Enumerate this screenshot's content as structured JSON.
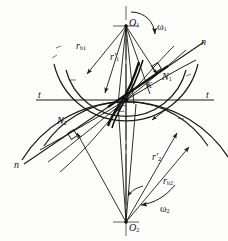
{
  "figure": {
    "type": "engineering-diagram",
    "background_color": "#fdfdfc",
    "ink_color": "#1a1a1a"
  },
  "labels": {
    "o1": "O",
    "o1_sub": "1",
    "o2": "O",
    "o2_sub": "2",
    "omega1": "ω",
    "omega1_sub": "1",
    "omega2": "ω",
    "omega2_sub": "2",
    "rb1": "r",
    "rb1_sub": "b1",
    "rb2": "r",
    "rb2_sub": "b2",
    "rp1": "r′",
    "rp1_sub": "1",
    "rp2": "r′",
    "rp2_sub": "2",
    "n1": "N",
    "n1_sub": "1",
    "n2": "N",
    "n2_sub": "2",
    "k": "K",
    "c": "C",
    "t_left": "t",
    "t_right": "t",
    "n_upper_right": "n",
    "n_lower_left": "n"
  },
  "geometry": {
    "center_o1": [
      126,
      26
    ],
    "center_o2": [
      126,
      222
    ],
    "pitch_point_c": [
      126,
      100
    ],
    "point_k": [
      150,
      86
    ],
    "point_n1": [
      160,
      78
    ],
    "point_n2": [
      73,
      127
    ],
    "tangent_line_y": 100,
    "radius_rb1": 62,
    "radius_rp1": 74,
    "radius_rb2": 98,
    "radius_rp2": 122
  }
}
